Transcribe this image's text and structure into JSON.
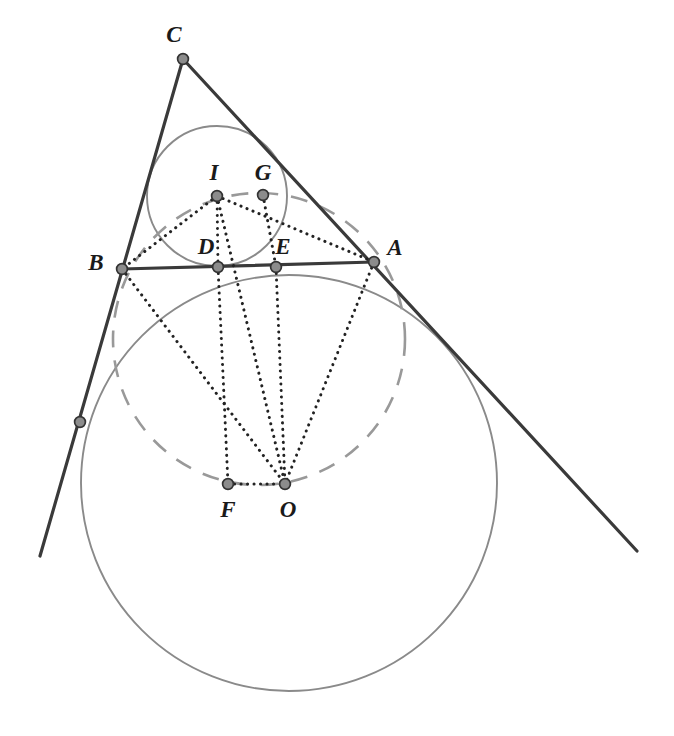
{
  "figure": {
    "width": 674,
    "height": 736,
    "background": "#ffffff",
    "colors": {
      "line_dark": "#3a3a3a",
      "line_solid_gray": "#8a8a8a",
      "line_dashed_gray": "#999999",
      "dotted_black": "#222222",
      "point_fill": "#8c8c8c",
      "point_stroke": "#333333",
      "label_color": "#1a1a1a"
    },
    "points": [
      {
        "id": "C",
        "label": "C",
        "x": 183,
        "y": 59,
        "label_x": 174,
        "label_y": 34
      },
      {
        "id": "B",
        "label": "B",
        "x": 122,
        "y": 269,
        "label_x": 96,
        "label_y": 262
      },
      {
        "id": "A",
        "label": "A",
        "x": 374,
        "y": 262,
        "label_x": 395,
        "label_y": 247
      },
      {
        "id": "I",
        "label": "I",
        "x": 217,
        "y": 196,
        "label_x": 214,
        "label_y": 172
      },
      {
        "id": "G",
        "label": "G",
        "x": 263,
        "y": 195,
        "label_x": 263,
        "label_y": 172
      },
      {
        "id": "D",
        "label": "D",
        "x": 218,
        "y": 267,
        "label_x": 206,
        "label_y": 246
      },
      {
        "id": "E",
        "label": "E",
        "x": 276,
        "y": 267,
        "label_x": 283,
        "label_y": 246
      },
      {
        "id": "F",
        "label": "F",
        "x": 228,
        "y": 484,
        "label_x": 228,
        "label_y": 509
      },
      {
        "id": "O",
        "label": "O",
        "x": 285,
        "y": 484,
        "label_x": 288,
        "label_y": 509
      },
      {
        "id": "T",
        "label": "",
        "x": 80,
        "y": 422,
        "label_x": 0,
        "label_y": 0
      }
    ],
    "circles": [
      {
        "id": "incircle",
        "style": "solid-gray",
        "cx": 217,
        "cy": 196,
        "r": 70
      },
      {
        "id": "excircle",
        "style": "solid-gray",
        "cx": 289,
        "cy": 483,
        "r": 208
      },
      {
        "id": "mid-circle",
        "style": "dashed-gray",
        "cx": 259,
        "cy": 339,
        "r": 146
      }
    ],
    "solid_segments": [
      {
        "id": "line-CA-extended",
        "x1": 183,
        "y1": 59,
        "x2": 637,
        "y2": 551
      },
      {
        "id": "line-CB-extended",
        "x1": 183,
        "y1": 59,
        "x2": 40,
        "y2": 556
      },
      {
        "id": "segment-BA",
        "x1": 122,
        "y1": 269,
        "x2": 374,
        "y2": 262
      }
    ],
    "dotted_segments": [
      {
        "id": "I-to-B",
        "x1": 217,
        "y1": 196,
        "x2": 122,
        "y2": 269
      },
      {
        "id": "I-to-A",
        "x1": 217,
        "y1": 196,
        "x2": 374,
        "y2": 262
      },
      {
        "id": "I-to-D",
        "x1": 217,
        "y1": 196,
        "x2": 218,
        "y2": 267
      },
      {
        "id": "I-to-O",
        "x1": 217,
        "y1": 196,
        "x2": 285,
        "y2": 484
      },
      {
        "id": "G-to-E",
        "x1": 263,
        "y1": 195,
        "x2": 276,
        "y2": 267
      },
      {
        "id": "B-to-O",
        "x1": 122,
        "y1": 269,
        "x2": 285,
        "y2": 484
      },
      {
        "id": "D-to-F",
        "x1": 218,
        "y1": 267,
        "x2": 228,
        "y2": 484
      },
      {
        "id": "E-to-O",
        "x1": 276,
        "y1": 267,
        "x2": 285,
        "y2": 484
      },
      {
        "id": "A-to-O",
        "x1": 374,
        "y1": 262,
        "x2": 285,
        "y2": 484
      },
      {
        "id": "F-to-O",
        "x1": 228,
        "y1": 484,
        "x2": 285,
        "y2": 484
      }
    ]
  }
}
